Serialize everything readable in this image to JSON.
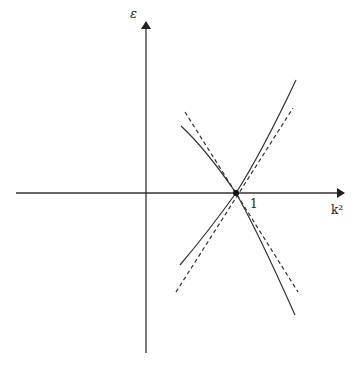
{
  "diagram": {
    "axes": {
      "y_label": "ε",
      "x_label": "k²",
      "tick_label": "1"
    },
    "colors": {
      "line": "#333333",
      "background": "#ffffff"
    },
    "elements": {
      "x_axis": {
        "x1": 16,
        "y1": 193,
        "x2": 344,
        "y2": 193
      },
      "y_axis": {
        "x1": 146,
        "y1": 353,
        "x2": 146,
        "y2": 22
      },
      "crossing_point": {
        "cx": 236,
        "cy": 193
      },
      "solid_curve_a": "M181,126 Q205,148 236,193 Q258,232 295,315",
      "solid_curve_b": "M180,265 Q208,232 236,193 Q262,152 296,80",
      "dashed_line_a": {
        "x1": 185,
        "y1": 112,
        "x2": 298,
        "y2": 292
      },
      "dashed_line_b": {
        "x1": 176,
        "y1": 292,
        "x2": 293,
        "y2": 108
      }
    }
  }
}
